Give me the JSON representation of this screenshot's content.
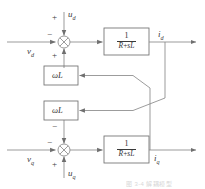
{
  "figure": {
    "type": "control-block-diagram",
    "caption": "图 3-4 解耦模型",
    "colors": {
      "line": "#8a8a8a",
      "box_border": "#6f6f6f",
      "text": "#404040",
      "background": "#ffffff"
    }
  },
  "labels": {
    "vd": "v",
    "vd_sub": "d",
    "ud": "u",
    "ud_sub": "d",
    "id": "i",
    "id_sub": "d",
    "vq": "v",
    "vq_sub": "q",
    "uq": "u",
    "uq_sub": "q",
    "iq": "i",
    "iq_sub": "q"
  },
  "signs": {
    "vd_sign": "−",
    "ud_sign": "+",
    "sum_d_bottom_sign": "+",
    "vq_sign": "−",
    "uq_sign": "+",
    "sum_q_top_sign": "−"
  },
  "blocks": {
    "plant_d": {
      "numerator": "1",
      "denominator_r": "R",
      "denominator_op": "+",
      "denominator_sl": "sL",
      "full": "1/(R+sL)"
    },
    "plant_q": {
      "numerator": "1",
      "denominator_r": "R",
      "denominator_op": "+",
      "denominator_sl": "sL",
      "full": "1/(R+sL)"
    },
    "coupling_upper": "ωL",
    "coupling_lower": "ωL"
  },
  "summing_junctions": {
    "d_axis": "cross-circle-sum",
    "q_axis": "cross-circle-sum"
  }
}
